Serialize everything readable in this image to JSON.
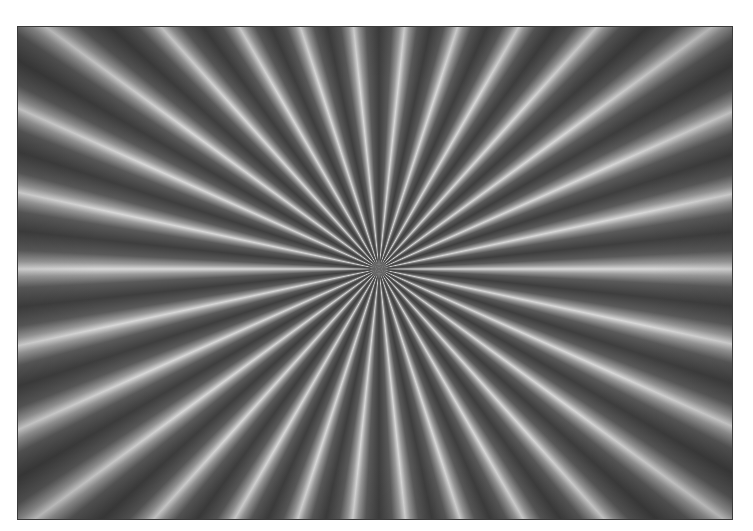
{
  "image": {
    "description": "Radial starburst test pattern",
    "ray_count": 30,
    "colors": {
      "ray_light": "#d8d8d8",
      "ray_dark": "#3e3e3e",
      "border": "#3a3a3a",
      "background": "#ffffff"
    }
  }
}
